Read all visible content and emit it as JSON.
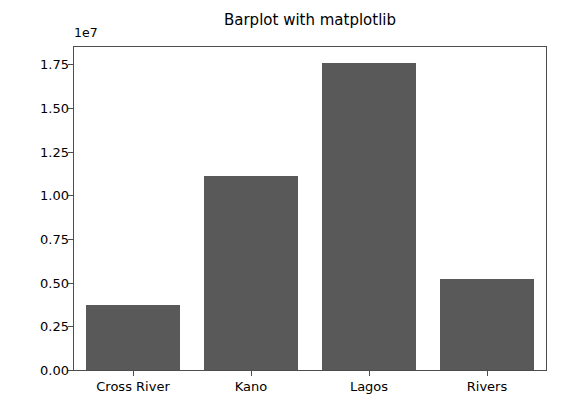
{
  "chart_data": {
    "type": "bar",
    "title": "Barplot with matplotlib",
    "xlabel": "",
    "ylabel": "",
    "offset_label": "1e7",
    "categories": [
      "Cross River",
      "Kano",
      "Lagos",
      "Rivers"
    ],
    "values": [
      3750000,
      11100000,
      17600000,
      5200000
    ],
    "ylim": [
      0,
      18500000
    ],
    "yticks": [
      0,
      2500000,
      5000000,
      7500000,
      10000000,
      12500000,
      15000000,
      17500000
    ],
    "ytick_labels": [
      "0.00",
      "0.25",
      "0.50",
      "0.75",
      "1.00",
      "1.25",
      "1.50",
      "1.75"
    ],
    "grid": false,
    "legend": null,
    "bar_color": "#595959",
    "bar_width_ratio": 0.8,
    "axes_edge_color": "#4d4d4d",
    "background_color": "#ffffff"
  }
}
